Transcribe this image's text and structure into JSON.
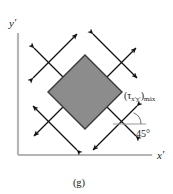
{
  "figure": {
    "caption": "(g)",
    "background_color": "#ffffff",
    "axes": {
      "y_label": "y",
      "y_prime": "′",
      "x_label": "x",
      "x_prime": "′",
      "axis_color": "#b5b5b5",
      "origin": {
        "x": 18,
        "y": 155
      }
    },
    "element": {
      "name": "rotated-stress-element",
      "shape": "diamond",
      "fill_color": "#8c8c8c",
      "stroke_color": "#3a3a3a",
      "rotation_degrees": 45,
      "center": {
        "x": 85,
        "y": 92
      },
      "half_diagonal": 37
    },
    "annotations": {
      "shear_stress_label": "(τ",
      "shear_stress_sub": "x′y′",
      "shear_stress_close": ")",
      "shear_stress_max": "máx",
      "angle_value": "45°",
      "arrow_color": "#111111",
      "arrow_count": 8,
      "arrow_description": "double-headed shear arrows crossing each face"
    }
  }
}
